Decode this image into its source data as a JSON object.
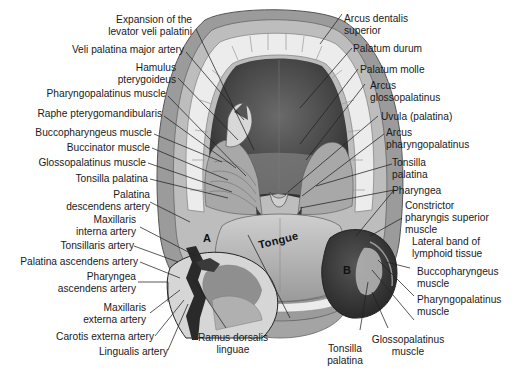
{
  "figure": {
    "inset_labels": {
      "a": "A",
      "b": "B"
    },
    "tongue_label": "Tongue"
  },
  "labels_left": [
    {
      "id": "expansion",
      "lines": [
        "Expansion of the",
        "levator veli palatini"
      ]
    },
    {
      "id": "veli-palatina-major-artery",
      "lines": [
        "Veli palatina major artery"
      ]
    },
    {
      "id": "hamulus",
      "lines": [
        "Hamulus",
        "pterygoideus"
      ]
    },
    {
      "id": "pharyngopalatinus-muscle",
      "lines": [
        "Pharyngopalatinus muscle"
      ]
    },
    {
      "id": "raphe",
      "lines": [
        "Raphe pterygomandibularis"
      ]
    },
    {
      "id": "buccopharyngeus-muscle",
      "lines": [
        "Buccopharyngeus muscle"
      ]
    },
    {
      "id": "buccinator-muscle",
      "lines": [
        "Buccinator muscle"
      ]
    },
    {
      "id": "glossopalatinus-muscle",
      "lines": [
        "Glossopalatinus muscle"
      ]
    },
    {
      "id": "tonsilla-palatina",
      "lines": [
        "Tonsilla palatina"
      ]
    },
    {
      "id": "palatina-descendens-artery",
      "lines": [
        "Palatina",
        "descendens artery"
      ]
    },
    {
      "id": "maxillaris-interna-artery",
      "lines": [
        "Maxillaris",
        "interna artery"
      ]
    },
    {
      "id": "tonsillaris-artery",
      "lines": [
        "Tonsillaris artery"
      ]
    },
    {
      "id": "palatina-ascendens-artery",
      "lines": [
        "Palatina ascendens artery"
      ]
    },
    {
      "id": "pharyngea-ascendens-artery",
      "lines": [
        "Pharyngea",
        "ascendens artery"
      ]
    },
    {
      "id": "maxillaris-externa-artery",
      "lines": [
        "Maxillaris",
        "externa artery"
      ]
    },
    {
      "id": "carotis-externa-artery",
      "lines": [
        "Carotis externa artery"
      ]
    },
    {
      "id": "lingualis-artery",
      "lines": [
        "Lingualis artery"
      ]
    }
  ],
  "labels_bottom": [
    {
      "id": "ramus-dorsalis-linguae",
      "lines": [
        "Ramus dorsalis",
        "linguae"
      ]
    },
    {
      "id": "tonsilla-palatina-b",
      "lines": [
        "Tonsilla",
        "palatina"
      ]
    },
    {
      "id": "glossopalatinus-muscle-b",
      "lines": [
        "Glossopalatinus",
        "muscle"
      ]
    }
  ],
  "labels_right": [
    {
      "id": "arcus-dentalis-superior",
      "lines": [
        "Arcus dentalis",
        "superior"
      ]
    },
    {
      "id": "palatum-durum",
      "lines": [
        "Palatum durum"
      ]
    },
    {
      "id": "palatum-molle",
      "lines": [
        "Palatum molle"
      ]
    },
    {
      "id": "arcus-glossopalatinus",
      "lines": [
        "Arcus",
        "glossopalatinus"
      ]
    },
    {
      "id": "uvula",
      "lines": [
        "Uvula (palatina)"
      ]
    },
    {
      "id": "arcus-pharyngopalatinus",
      "lines": [
        "Arcus",
        "pharyngopalatinus"
      ]
    },
    {
      "id": "tonsilla-palatina-right",
      "lines": [
        "Tonsilla",
        "palatina"
      ]
    },
    {
      "id": "pharyngea",
      "lines": [
        "Pharyngea"
      ]
    },
    {
      "id": "constrictor",
      "lines": [
        "Constrictor",
        "pharyngis superior",
        "muscle"
      ]
    },
    {
      "id": "lateral-band",
      "lines": [
        "Lateral band of",
        "lymphoid tissue"
      ]
    },
    {
      "id": "buccopharyngeus-muscle-b",
      "lines": [
        "Buccopharyngeus",
        "muscle"
      ]
    },
    {
      "id": "pharyngopalatinus-muscle-b",
      "lines": [
        "Pharyngopalatinus",
        "muscle"
      ]
    }
  ],
  "colors": {
    "background": "#ffffff",
    "text": "#1a1a1a",
    "palate_dark": "#4a4a4a",
    "gum": "#8a8a8a",
    "teeth": "#e8e8e8",
    "tongue": "#b5b5b5",
    "inset_b": "#3c3c3c",
    "leader": "#222222"
  }
}
